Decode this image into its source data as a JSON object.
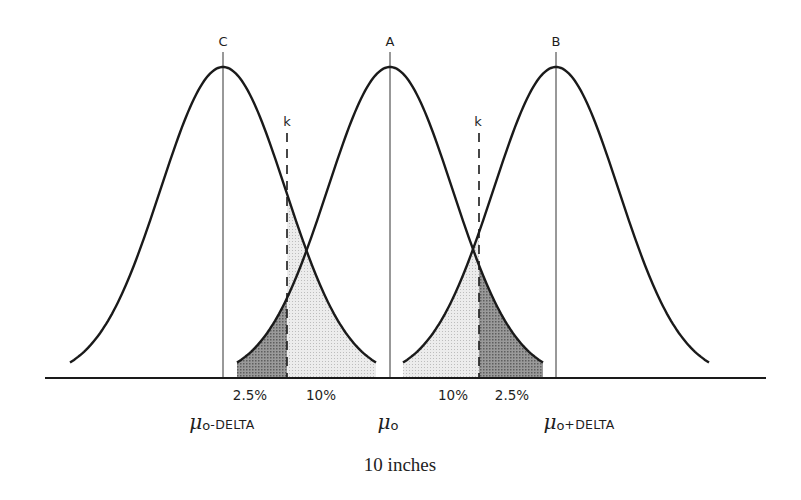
{
  "diagram": {
    "type": "overlapping-normal-distributions",
    "curves": [
      {
        "id": "C",
        "label": "C",
        "center_label": "μ0 - DELTA",
        "center_x": 223
      },
      {
        "id": "A",
        "label": "A",
        "center_label": "μ0",
        "center_x": 390
      },
      {
        "id": "B",
        "label": "B",
        "center_label": "μ0 + DELTA",
        "center_x": 556
      }
    ],
    "critical_values": [
      {
        "label": "k",
        "x": 287
      },
      {
        "label": "k",
        "x": 479
      }
    ],
    "area_labels": [
      {
        "text": "2.5%",
        "x": 250
      },
      {
        "text": "10%",
        "x": 321
      },
      {
        "text": "10%",
        "x": 453
      },
      {
        "text": "2.5%",
        "x": 512
      }
    ],
    "axis_labels": {
      "left": {
        "mu": "μ",
        "sub": "o",
        "suffix": "-DELTA"
      },
      "center": {
        "mu": "μ",
        "sub": "o",
        "suffix": ""
      },
      "right": {
        "mu": "μ",
        "sub": "o",
        "suffix": "+DELTA"
      }
    },
    "colors": {
      "line": "#1a1a1a",
      "dark_shade": "#8a8a8a",
      "light_shade": "#dcdcdc"
    }
  },
  "caption": "10 inches"
}
